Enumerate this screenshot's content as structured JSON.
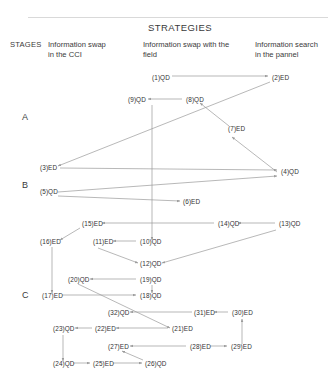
{
  "title": "STRATEGIES",
  "stages_header": "STAGES",
  "columns": [
    {
      "id": "col-cci",
      "label": "Information swap\nin the CCI",
      "x": 48,
      "y": 40,
      "w": 92
    },
    {
      "id": "col-field",
      "label": "Information swap with the\nfield",
      "x": 143,
      "y": 40,
      "w": 110
    },
    {
      "id": "col-pannel",
      "label": "Information search\nin the pannel",
      "x": 255,
      "y": 40,
      "w": 78
    }
  ],
  "stages": [
    {
      "id": "stage-a",
      "label": "A",
      "x": 22,
      "y": 113
    },
    {
      "id": "stage-b",
      "label": "B",
      "x": 22,
      "y": 181
    },
    {
      "id": "stage-c",
      "label": "C",
      "x": 22,
      "y": 291
    }
  ],
  "rules": [
    {
      "x": 28,
      "y": 17,
      "w": 300
    }
  ],
  "chart_data": {
    "type": "diagram",
    "title": "STRATEGIES",
    "xlabel": "",
    "ylabel": "STAGES",
    "grid": false,
    "legend": "none",
    "axis_columns": [
      "Information swap in the CCI",
      "Information swap with the field",
      "Information search in the pannel"
    ],
    "axis_rows": [
      "A",
      "B",
      "C"
    ],
    "nodes": [
      {
        "id": 1,
        "label": "(1)QD",
        "x": 152,
        "y": 79,
        "stage": "A",
        "column": "field"
      },
      {
        "id": 2,
        "label": "(2)ED",
        "x": 272,
        "y": 79,
        "stage": "A",
        "column": "pannel"
      },
      {
        "id": 9,
        "label": "(9)QD",
        "x": 128,
        "y": 101,
        "stage": "A",
        "column": "field"
      },
      {
        "id": 8,
        "label": "(8)QD",
        "x": 186,
        "y": 101,
        "stage": "A",
        "column": "field"
      },
      {
        "id": 7,
        "label": "(7)ED",
        "x": 228,
        "y": 130,
        "stage": "A",
        "column": "field"
      },
      {
        "id": 3,
        "label": "(3)ED",
        "x": 40,
        "y": 169,
        "stage": "B",
        "column": "cci"
      },
      {
        "id": 4,
        "label": "(4)QD",
        "x": 281,
        "y": 173,
        "stage": "B",
        "column": "pannel"
      },
      {
        "id": 5,
        "label": "(5)QD",
        "x": 40,
        "y": 193,
        "stage": "B",
        "column": "cci"
      },
      {
        "id": 6,
        "label": "(6)ED",
        "x": 183,
        "y": 203,
        "stage": "B",
        "column": "field"
      },
      {
        "id": 15,
        "label": "(15)ED",
        "x": 82,
        "y": 225,
        "stage": "B",
        "column": "cci"
      },
      {
        "id": 14,
        "label": "(14)QD",
        "x": 218,
        "y": 225,
        "stage": "B",
        "column": "field"
      },
      {
        "id": 13,
        "label": "(13)QD",
        "x": 279,
        "y": 225,
        "stage": "B",
        "column": "pannel"
      },
      {
        "id": 16,
        "label": "(16)ED",
        "x": 40,
        "y": 243,
        "stage": "B",
        "column": "cci"
      },
      {
        "id": 11,
        "label": "(11)ED",
        "x": 93,
        "y": 243,
        "stage": "B",
        "column": "cci"
      },
      {
        "id": 10,
        "label": "(10)QD",
        "x": 140,
        "y": 243,
        "stage": "B",
        "column": "field"
      },
      {
        "id": 12,
        "label": "(12)QD",
        "x": 140,
        "y": 265,
        "stage": "B",
        "column": "field"
      },
      {
        "id": 20,
        "label": "(20)QD",
        "x": 68,
        "y": 281,
        "stage": "C",
        "column": "cci"
      },
      {
        "id": 19,
        "label": "(19)QD",
        "x": 140,
        "y": 281,
        "stage": "C",
        "column": "field"
      },
      {
        "id": 17,
        "label": "(17)ED",
        "x": 42,
        "y": 297,
        "stage": "C",
        "column": "cci"
      },
      {
        "id": 18,
        "label": "(18)QD",
        "x": 140,
        "y": 297,
        "stage": "C",
        "column": "field"
      },
      {
        "id": 32,
        "label": "(32)QD",
        "x": 108,
        "y": 314,
        "stage": "C",
        "column": "cci"
      },
      {
        "id": 31,
        "label": "(31)ED",
        "x": 194,
        "y": 314,
        "stage": "C",
        "column": "field"
      },
      {
        "id": 30,
        "label": "(30)ED",
        "x": 232,
        "y": 314,
        "stage": "C",
        "column": "pannel"
      },
      {
        "id": 23,
        "label": "(23)QD",
        "x": 53,
        "y": 330,
        "stage": "C",
        "column": "cci"
      },
      {
        "id": 22,
        "label": "(22)ED",
        "x": 95,
        "y": 330,
        "stage": "C",
        "column": "cci"
      },
      {
        "id": 21,
        "label": "(21)ED",
        "x": 172,
        "y": 330,
        "stage": "C",
        "column": "field"
      },
      {
        "id": 27,
        "label": "(27)ED",
        "x": 108,
        "y": 348,
        "stage": "C",
        "column": "cci"
      },
      {
        "id": 28,
        "label": "(28)ED",
        "x": 190,
        "y": 348,
        "stage": "C",
        "column": "field"
      },
      {
        "id": 29,
        "label": "(29)ED",
        "x": 231,
        "y": 348,
        "stage": "C",
        "column": "pannel"
      },
      {
        "id": 24,
        "label": "(24)QD",
        "x": 53,
        "y": 365,
        "stage": "C",
        "column": "cci"
      },
      {
        "id": 25,
        "label": "(25)ED",
        "x": 93,
        "y": 365,
        "stage": "C",
        "column": "cci"
      },
      {
        "id": 26,
        "label": "(26)QD",
        "x": 145,
        "y": 365,
        "stage": "C",
        "column": "field"
      }
    ],
    "edges": [
      {
        "from": 1,
        "to": 2,
        "path": "M172,76 L268,76"
      },
      {
        "from": 2,
        "to": 3,
        "path": "M270,82 L58,166"
      },
      {
        "from": 8,
        "to": 9,
        "path": "M182,99 L148,99"
      },
      {
        "from": 7,
        "to": 8,
        "path": "M229,126 L200,103"
      },
      {
        "from": 4,
        "to": 7,
        "path": "M277,172 L232,137"
      },
      {
        "from": 3,
        "to": 4,
        "path": "M60,168 L277,170"
      },
      {
        "from": 5,
        "to": 4,
        "path": "M58,192 L277,176"
      },
      {
        "from": 5,
        "to": 6,
        "path": "M58,196 L180,201"
      },
      {
        "from": 13,
        "to": 14,
        "path": "M275,223 L238,223"
      },
      {
        "from": 14,
        "to": 15,
        "path": "M214,223 L102,223"
      },
      {
        "from": 15,
        "to": 16,
        "path": "M80,228 L60,240"
      },
      {
        "from": 10,
        "to": 11,
        "path": "M136,241 L113,241"
      },
      {
        "from": 11,
        "to": 12,
        "path": "M98,248 L138,263"
      },
      {
        "from": 13,
        "to": 12,
        "path": "M276,230 L162,263"
      },
      {
        "from": 9,
        "to": 10,
        "path": "M152,105 L152,240"
      },
      {
        "from": 19,
        "to": 20,
        "path": "M136,279 L90,279"
      },
      {
        "from": 19,
        "to": 18,
        "path": "M152,285 L152,293"
      },
      {
        "from": 17,
        "to": 18,
        "path": "M62,295 L136,295"
      },
      {
        "from": 16,
        "to": 17,
        "path": "M52,247 L52,293"
      },
      {
        "from": 20,
        "to": 21,
        "path": "M78,284 L170,328"
      },
      {
        "from": 31,
        "to": 32,
        "path": "M192,312 L130,312"
      },
      {
        "from": 30,
        "to": 31,
        "path": "M228,312 L214,312"
      },
      {
        "from": 29,
        "to": 30,
        "path": "M242,344 L242,319"
      },
      {
        "from": 22,
        "to": 23,
        "path": "M92,328 L75,328"
      },
      {
        "from": 21,
        "to": 22,
        "path": "M168,328 L116,328"
      },
      {
        "from": 28,
        "to": 27,
        "path": "M186,346 L130,346"
      },
      {
        "from": 28,
        "to": 29,
        "path": "M210,346 L227,346"
      },
      {
        "from": 23,
        "to": 24,
        "path": "M63,335 L63,361"
      },
      {
        "from": 24,
        "to": 25,
        "path": "M73,363 L90,363"
      },
      {
        "from": 25,
        "to": 26,
        "path": "M113,363 L142,363"
      },
      {
        "from": 26,
        "to": 27,
        "path": "M143,360 L122,351"
      }
    ]
  }
}
